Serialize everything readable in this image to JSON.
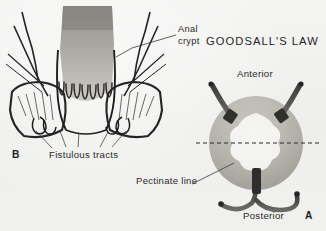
{
  "figure": {
    "title": "GOODSALL'S LAW",
    "background_color": "#f2f2f1",
    "ink_color": "#2a2a2a",
    "width": 326,
    "height": 231
  },
  "labels": {
    "anal_crypt_line1": "Anal",
    "anal_crypt_line2": "crypt",
    "anterior": "Anterior",
    "posterior": "Posterior",
    "pectinate_line": "Pectinate line",
    "fistulous_tracts": "Fistulous tracts"
  },
  "panels": [
    {
      "letter": "B",
      "name": "coronal-anal-canal",
      "description": "Coronal section through the anal canal showing anal crypts, pectinate line and fistulous tracts"
    },
    {
      "letter": "A",
      "name": "goodsalls-law-ring",
      "description": "Transverse ring diagram of the anus illustrating Goodsall's law: anterior fistulas track radially, posterior fistulas curve to the posterior midline"
    }
  ],
  "ring_diagram": {
    "transverse_line": "dashed",
    "anterior_tracts": 2,
    "posterior_tracts": 2,
    "midline_tract": 1
  }
}
